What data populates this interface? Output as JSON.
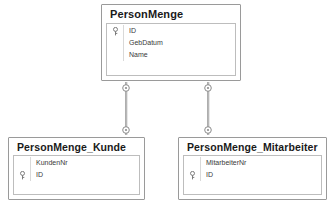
{
  "diagram": {
    "type": "entity-relationship-diagram",
    "background_color": "#ffffff",
    "border_color": "#9a9a9a",
    "inner_border_color": "#bdbdbd",
    "text_color": "#1a1a1a",
    "field_text_color": "#3a3a3a",
    "connector_color": "#8c8c8c"
  },
  "entities": [
    {
      "id": "PersonMenge",
      "title": "PersonMenge",
      "fields": [
        {
          "name": "ID",
          "key": true,
          "key_icon": "key-icon"
        },
        {
          "name": "GebDatum",
          "key": false
        },
        {
          "name": "Name",
          "key": false
        }
      ]
    },
    {
      "id": "PersonMenge_Kunde",
      "title": "PersonMenge_Kunde",
      "fields": [
        {
          "name": "KundenNr",
          "key": false
        },
        {
          "name": "ID",
          "key": true,
          "key_icon": "key-icon"
        }
      ]
    },
    {
      "id": "PersonMenge_Mitarbeiter",
      "title": "PersonMenge_Mitarbeiter",
      "fields": [
        {
          "name": "MitarbeiterNr",
          "key": false
        },
        {
          "name": "ID",
          "key": true,
          "key_icon": "key-icon"
        }
      ]
    }
  ],
  "relationships": [
    {
      "id": "rel-personmenge-kunde",
      "from": "PersonMenge",
      "to": "PersonMenge_Kunde",
      "from_cardinality": "zero-or-one",
      "to_cardinality": "zero-or-one",
      "marker": "ring"
    },
    {
      "id": "rel-personmenge-mitarbeiter",
      "from": "PersonMenge",
      "to": "PersonMenge_Mitarbeiter",
      "from_cardinality": "zero-or-one",
      "to_cardinality": "zero-or-one",
      "marker": "ring"
    }
  ]
}
